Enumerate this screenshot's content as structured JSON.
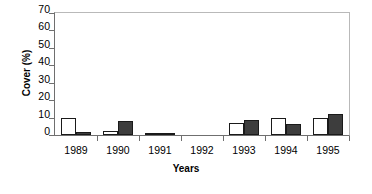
{
  "chart_data": {
    "type": "bar",
    "title": "",
    "xlabel": "Years",
    "ylabel": "Cover (%)",
    "categories": [
      "1989",
      "1990",
      "1991",
      "1992",
      "1993",
      "1994",
      "1995"
    ],
    "ylim": [
      0,
      70
    ],
    "ytick_labels": [
      "70",
      "60",
      "50",
      "40",
      "30",
      "20",
      "10",
      "0"
    ],
    "ytick_values": [
      70,
      60,
      50,
      40,
      30,
      20,
      10,
      0
    ],
    "grid": false,
    "legend": "none",
    "series": [
      {
        "name": "open",
        "style": "white-fill-black-outline",
        "color": "#ffffff",
        "values": [
          10.0,
          2.5,
          0.8,
          0.0,
          7.0,
          9.5,
          10.0
        ]
      },
      {
        "name": "filled",
        "style": "dark-fill-black-outline",
        "color": "#3d3d3d",
        "values": [
          1.5,
          8.0,
          1.0,
          0.0,
          8.5,
          6.5,
          12.0
        ]
      }
    ]
  }
}
